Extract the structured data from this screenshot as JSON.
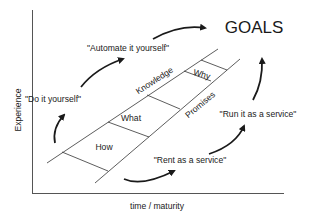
{
  "diagram": {
    "goal_label": "GOALS",
    "axes": {
      "x_label": "time / maturity",
      "y_label": "Experience"
    },
    "ladder": {
      "left_rail_label": "Knowledge",
      "right_rail_label": "Promises",
      "rungs": [
        "How",
        "What",
        "Why"
      ]
    },
    "upper_path": [
      "\"Do it yourself\"",
      "\"Automate it yourself\""
    ],
    "lower_path": [
      "\"Rent as a service\"",
      "\"Run it as a service\""
    ],
    "colors": {
      "line": "#1a1a1a",
      "axis": "#555555",
      "background": "#ffffff"
    }
  }
}
